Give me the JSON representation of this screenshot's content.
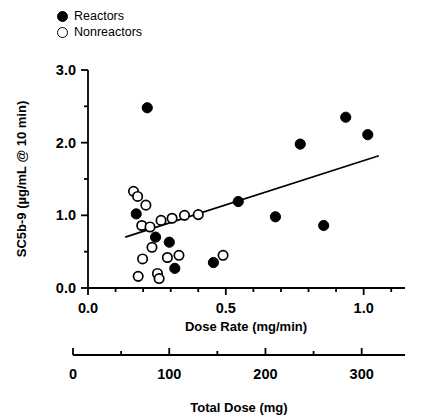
{
  "legend": {
    "position": "top-left",
    "items": [
      {
        "label": "Reactors",
        "marker": "filled-circle-icon"
      },
      {
        "label": "Nonreactors",
        "marker": "open-circle-icon"
      }
    ]
  },
  "chart_data": {
    "type": "scatter",
    "title": "",
    "xlabel": "Dose Rate (mg/min)",
    "ylabel": "SC5b-9 (µg/mL @ 10 min)",
    "xlim": [
      0.0,
      1.15
    ],
    "ylim": [
      0.0,
      3.0
    ],
    "grid": false,
    "xticks": [
      0.0,
      0.5,
      1.0
    ],
    "xticklabels": [
      "0.0",
      "0.5",
      "1.0"
    ],
    "xminor_step": 0.1,
    "yticks": [
      0.0,
      1.0,
      2.0,
      3.0
    ],
    "yticklabels": [
      "0.0",
      "1.0",
      "2.0",
      "3.0"
    ],
    "yminor_step": 0.5,
    "secondary_axis": {
      "label": "Total Dose (mg)",
      "ticks": [
        0,
        100,
        200,
        300
      ],
      "ticklabels": [
        "0",
        "100",
        "200",
        "300"
      ],
      "minor_step": 50,
      "lim": [
        0,
        345
      ]
    },
    "series": [
      {
        "name": "Reactors",
        "marker": "filled-circle",
        "points": [
          [
            0.215,
            2.48
          ],
          [
            0.175,
            1.02
          ],
          [
            0.245,
            0.7
          ],
          [
            0.295,
            0.63
          ],
          [
            0.315,
            0.27
          ],
          [
            0.455,
            0.35
          ],
          [
            0.545,
            1.19
          ],
          [
            0.68,
            0.98
          ],
          [
            0.77,
            1.98
          ],
          [
            0.855,
            0.86
          ],
          [
            0.935,
            2.35
          ],
          [
            1.015,
            2.11
          ]
        ]
      },
      {
        "name": "Nonreactors",
        "marker": "open-circle",
        "points": [
          [
            0.165,
            1.33
          ],
          [
            0.18,
            1.26
          ],
          [
            0.21,
            1.14
          ],
          [
            0.195,
            0.86
          ],
          [
            0.225,
            0.84
          ],
          [
            0.265,
            0.93
          ],
          [
            0.305,
            0.96
          ],
          [
            0.35,
            1.0
          ],
          [
            0.4,
            1.01
          ],
          [
            0.232,
            0.56
          ],
          [
            0.198,
            0.4
          ],
          [
            0.288,
            0.42
          ],
          [
            0.33,
            0.45
          ],
          [
            0.182,
            0.16
          ],
          [
            0.252,
            0.2
          ],
          [
            0.258,
            0.13
          ],
          [
            0.49,
            0.45
          ]
        ]
      }
    ],
    "trendline": {
      "label": "regression-line",
      "x_start": 0.135,
      "y_start": 0.7,
      "x_end": 1.055,
      "y_end": 1.82
    }
  }
}
